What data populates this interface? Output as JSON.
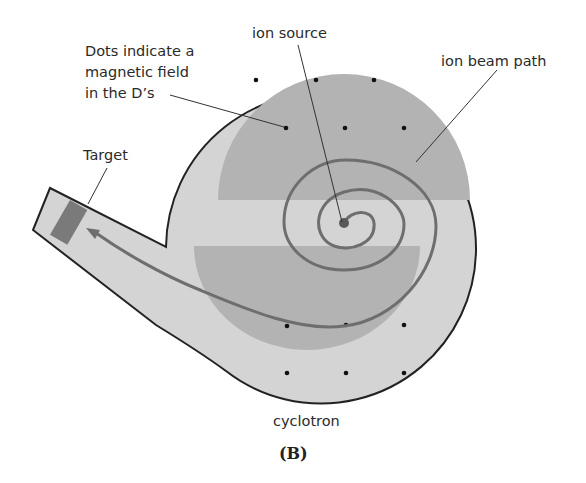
{
  "figure": {
    "panel_label": "(B)",
    "caption": "cyclotron",
    "labels": {
      "dots_line1": "Dots indicate a",
      "dots_line2": "magnetic field",
      "dots_line3": "in the D’s",
      "ion_source": "ion source",
      "ion_beam_path": "ion beam path",
      "target": "Target"
    },
    "colors": {
      "chamber_fill": "#d4d4d4",
      "dee_fill": "#b3b3b3",
      "beam": "#6e6e6e",
      "target_fill": "#7a7a7a",
      "outline": "#222222"
    }
  }
}
